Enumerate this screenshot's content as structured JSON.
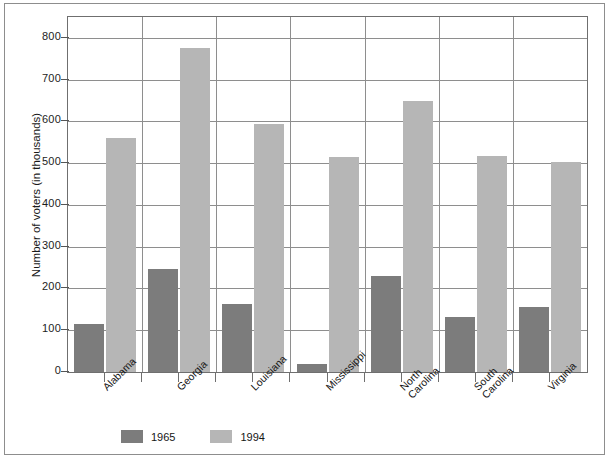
{
  "chart_data": {
    "type": "bar",
    "title": "",
    "xlabel": "",
    "ylabel": "Number of voters (in thousands)",
    "categories": [
      "Alabama",
      "Georgia",
      "Louisiana",
      "Mississippi",
      "North Carolina",
      "South Carolina",
      "Virginia"
    ],
    "series": [
      {
        "name": "1965",
        "color": "#7c7c7c",
        "values": [
          115,
          247,
          164,
          20,
          231,
          131,
          155
        ]
      },
      {
        "name": "1994",
        "color": "#b6b6b6",
        "values": [
          560,
          775,
          595,
          515,
          648,
          518,
          503
        ]
      }
    ],
    "ylim": [
      0,
      850
    ],
    "yticks": [
      0,
      100,
      200,
      300,
      400,
      500,
      600,
      700,
      800
    ],
    "ytick_labels": [
      "0",
      "100",
      "200",
      "300",
      "400",
      "500",
      "600",
      "700",
      "800"
    ],
    "grid": "horizontal-and-vertical-category-separators",
    "legend_position": "bottom-left",
    "legend_entries": [
      "1965",
      "1994"
    ]
  }
}
